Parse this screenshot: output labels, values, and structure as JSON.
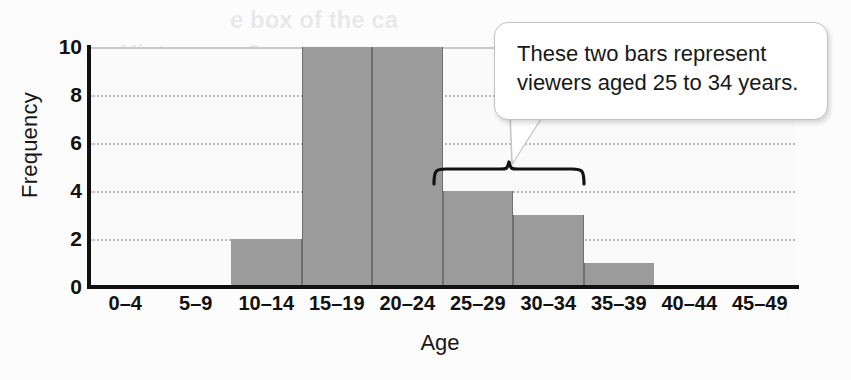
{
  "chart_data": {
    "type": "bar",
    "title": "",
    "xlabel": "Age",
    "ylabel": "Frequency",
    "categories": [
      "0–4",
      "5–9",
      "10–14",
      "15–19",
      "20–24",
      "25–29",
      "30–34",
      "35–39",
      "40–44",
      "45–49"
    ],
    "values": [
      0,
      0,
      2,
      10,
      10,
      4,
      3,
      1,
      0,
      0
    ],
    "ylim": [
      0,
      10
    ],
    "yticks": [
      0,
      2,
      4,
      6,
      8,
      10
    ],
    "ytick_labels": [
      "0",
      "2",
      "4",
      "6",
      "8",
      "10"
    ],
    "grid": true,
    "legend": false,
    "bar_color": "#9b9b9b",
    "annotations": [
      {
        "kind": "callout",
        "text": "These two bars represent\nviewers aged 25 to 34 years.",
        "targets": [
          "25–29",
          "30–34"
        ]
      },
      {
        "kind": "brace",
        "spans": [
          "25–29",
          "30–34"
        ]
      }
    ]
  },
  "axes": {
    "y_title": "Frequency",
    "x_title": "Age",
    "y_ticks": [
      "10",
      "8",
      "6",
      "4",
      "2",
      "0"
    ],
    "x_ticks": [
      "0–4",
      "5–9",
      "10–14",
      "15–19",
      "20–24",
      "25–29",
      "30–34",
      "35–39",
      "40–44",
      "45–49"
    ]
  },
  "callout": {
    "text": "These two bars represent\nviewers aged 25 to 34 years."
  },
  "ghost_text": {
    "line1": "e box of the ca",
    "line2": "Histogram C"
  },
  "colors": {
    "bar": "#9b9b9b",
    "bar_edge": "#6f6f6f",
    "axis": "#111111",
    "grid": "#b9b9b9",
    "plot_bg": "#fafafa",
    "page_bg": "#fcfcfc",
    "callout_border": "#c2c2c2"
  }
}
